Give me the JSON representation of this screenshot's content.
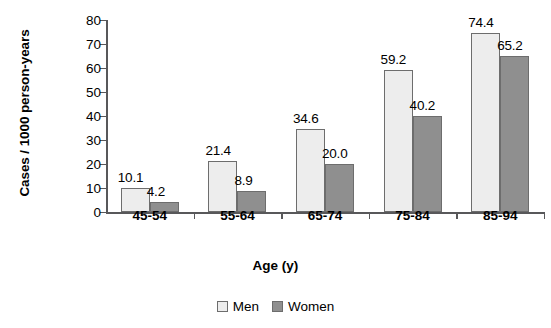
{
  "chart_data": {
    "type": "bar",
    "title": "",
    "subtitle": "",
    "xlabel": "Age (y)",
    "ylabel": "Cases / 1000 person-years",
    "categories": [
      "45-54",
      "55-64",
      "65-74",
      "75-84",
      "85-94"
    ],
    "series": [
      {
        "name": "Men",
        "color": "#ededed",
        "values": [
          10.1,
          21.4,
          34.6,
          59.2,
          74.4
        ],
        "labels": [
          "10.1",
          "21.4",
          "34.6",
          "59.2",
          "74.4"
        ]
      },
      {
        "name": "Women",
        "color": "#8f8f8f",
        "values": [
          4.2,
          8.9,
          20.0,
          40.2,
          65.2
        ],
        "labels": [
          "4.2",
          "8.9",
          "20.0",
          "40.2",
          "65.2"
        ]
      }
    ],
    "ylim": [
      0,
      80
    ],
    "ytick_values": [
      0,
      10,
      20,
      30,
      40,
      50,
      60,
      70,
      80
    ],
    "ytick_labels": [
      "0",
      "10",
      "20",
      "30",
      "40",
      "50",
      "60",
      "70",
      "80"
    ],
    "grid": false,
    "legend_position": "bottom-center",
    "axis_color": "#58585a",
    "bar_border_color": "#6d6d6d"
  },
  "legend": {
    "items": [
      {
        "label": "Men"
      },
      {
        "label": "Women"
      }
    ]
  }
}
